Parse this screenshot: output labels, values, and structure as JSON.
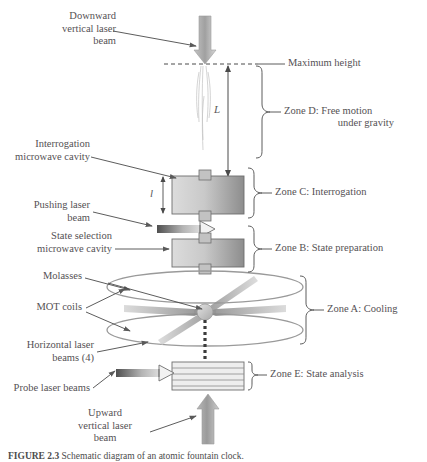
{
  "figure": {
    "background_color": "#ffffff",
    "ink_color": "#555154",
    "caption_label": "FIGURE 2.3",
    "caption_text": "Schematic diagram of an atomic fountain clock."
  },
  "labels": {
    "downward_beam": "Downward\nvertical laser\nbeam",
    "maximum_height": "Maximum height",
    "interrogation_cavity": "Interrogation\nmicrowave cavity",
    "pushing_beam": "Pushing laser\nbeam",
    "state_selection_cavity": "State selection\nmicrowave cavity",
    "molasses": "Molasses",
    "mot_coils": "MOT coils",
    "horizontal_beams": "Horizontal laser\nbeams (4)",
    "probe_beams": "Probe laser beams",
    "upward_beam": "Upward\nvertical laser\nbeam"
  },
  "dimensions": {
    "big_L": "L",
    "small_l": "l"
  },
  "zones": [
    {
      "id": "D",
      "line1": "Zone D: Free motion",
      "line2": "under gravity"
    },
    {
      "id": "C",
      "line1": "Zone C: Interrogation",
      "line2": ""
    },
    {
      "id": "B",
      "line1": "Zone B: State preparation",
      "line2": ""
    },
    {
      "id": "A",
      "line1": "Zone A: Cooling",
      "line2": ""
    },
    {
      "id": "E",
      "line1": "Zone E: State analysis",
      "line2": ""
    }
  ],
  "colors": {
    "beam_gray": "#9d9d9d",
    "cavity_light": "#d8d8d8",
    "cavity_dark": "#8e8e8e",
    "coil_outline": "#9a9a9a",
    "trajectory": "#4a4a4a"
  }
}
